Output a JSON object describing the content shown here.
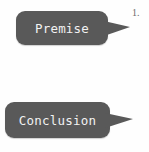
{
  "diagram": {
    "background_color": "#fefefe",
    "bubble_color": "#595959",
    "bubble_text_color": "#f2f2f2",
    "marker_color": "#6b6b6b",
    "list_marker": "1.",
    "nodes": [
      {
        "id": "premise",
        "label": "Premise",
        "shape": "rounded-speech-bubble",
        "tail_direction": "right"
      },
      {
        "id": "conclusion",
        "label": "Conclusion",
        "shape": "rounded-speech-bubble",
        "tail_direction": "right"
      }
    ]
  }
}
